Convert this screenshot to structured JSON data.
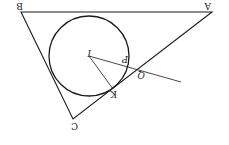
{
  "diagram": {
    "rotation_deg": 180,
    "points": {
      "A": {
        "label": "A",
        "x": 212,
        "y": 12
      },
      "B": {
        "label": "B",
        "x": 21,
        "y": 12
      },
      "C": {
        "label": "C",
        "x": 73,
        "y": 119
      },
      "I": {
        "label": "I",
        "x": 89,
        "y": 56
      },
      "K": {
        "label": "K",
        "x": 113,
        "y": 89
      },
      "P": {
        "label": "P",
        "x": 128,
        "y": 64
      },
      "Q": {
        "label": "Q",
        "x": 138,
        "y": 70
      }
    },
    "incircle": {
      "cx": 89,
      "cy": 56,
      "r": 40
    },
    "line_end": {
      "x": 181,
      "y": 82
    },
    "stroke_color": "#1a1a1a"
  }
}
